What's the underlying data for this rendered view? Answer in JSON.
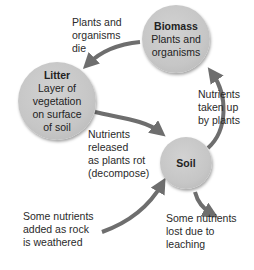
{
  "nodes": {
    "biomass": {
      "title": "Biomass",
      "desc": [
        "Plants and",
        "organisms"
      ]
    },
    "litter": {
      "title": "Litter",
      "desc": [
        "Layer of",
        "vegetation",
        "on surface",
        "of soil"
      ]
    },
    "soil": {
      "title": "Soil"
    }
  },
  "labels": {
    "plants_die": [
      "Plants and",
      "organisms",
      "die"
    ],
    "nutrients_taken": [
      "Nutrients",
      "taken up",
      "by plants"
    ],
    "nutrients_released": [
      "Nutrients",
      "released",
      "as plants rot",
      "(decompose)"
    ],
    "nutrients_added": [
      "Some nutrients",
      "added as rock",
      "is weathered"
    ],
    "nutrients_lost": [
      "Some nutrients",
      "lost due to",
      "leaching"
    ]
  },
  "colors": {
    "arrow": "#6e6e6e",
    "node": "#c6c6c6",
    "text": "#2a2a2a"
  }
}
